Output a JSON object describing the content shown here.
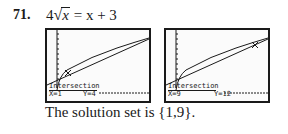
{
  "problem": {
    "number": "71.",
    "equation": {
      "coefficient": "4",
      "radical_symbol": "√",
      "radicand": "x",
      "rhs": "= x + 3"
    }
  },
  "screens": [
    {
      "label": "Intersection",
      "x_readout": "X=1",
      "y_readout": "Y=4",
      "intersection": {
        "x": 1,
        "y": 4
      }
    },
    {
      "label": "Intersection",
      "x_readout": "X=9",
      "y_readout": "Y=12",
      "intersection": {
        "x": 9,
        "y": 12
      }
    }
  ],
  "solution": {
    "text": "The solution set is",
    "set": "{1,9}",
    "period": "."
  },
  "colors": {
    "ink": "#1a1a1a",
    "background": "#ffffff"
  }
}
